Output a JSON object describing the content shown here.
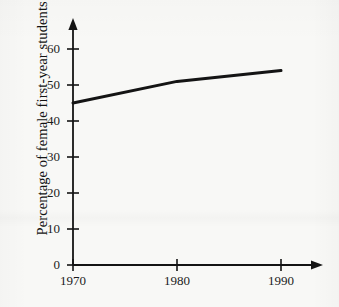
{
  "figure": {
    "background_color": "#f8f8f6",
    "ink_color": "#141414"
  },
  "axis_titles": {
    "y": "Percentage of female first-year students",
    "x": ""
  },
  "y_ticks": [
    {
      "label": "0",
      "value": 0
    },
    {
      "label": "10",
      "value": 10
    },
    {
      "label": "20",
      "value": 20
    },
    {
      "label": "30",
      "value": 30
    },
    {
      "label": "40",
      "value": 40
    },
    {
      "label": "50",
      "value": 50
    },
    {
      "label": "60",
      "value": 60
    }
  ],
  "x_ticks": [
    {
      "label": "1970",
      "value": 1970
    },
    {
      "label": "1980",
      "value": 1980
    },
    {
      "label": "1990",
      "value": 1990
    }
  ],
  "chart_data": {
    "type": "line",
    "title": "",
    "xlabel": "",
    "ylabel": "Percentage of female first-year students",
    "x": [
      1970,
      1980,
      1990
    ],
    "values": [
      45,
      51,
      54
    ],
    "series": [
      {
        "name": "Percentage of female first-year students",
        "x": [
          1970,
          1980,
          1990
        ],
        "values": [
          45,
          51,
          54
        ]
      }
    ],
    "xlim": [
      1970,
      1993
    ],
    "ylim": [
      0,
      64
    ],
    "xtick_labels": [
      "1970",
      "1980",
      "1990"
    ],
    "ytick_labels": [
      "0",
      "10",
      "20",
      "30",
      "40",
      "50",
      "60"
    ],
    "grid": false,
    "legend": "none",
    "line_color": "#141414",
    "line_width": 3,
    "axis_arrows": true,
    "annotations": []
  }
}
